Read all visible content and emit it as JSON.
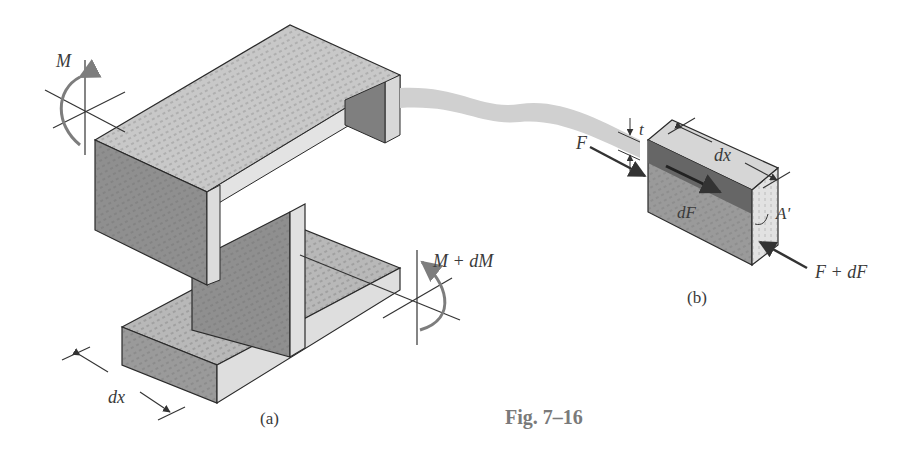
{
  "figure": {
    "caption": "Fig. 7–16",
    "part_a": {
      "label": "(a)",
      "moment_left": "M",
      "moment_right": "M + dM",
      "dimension": "dx"
    },
    "part_b": {
      "label": "(b)",
      "force_in": "F",
      "force_out": "F + dF",
      "thickness": "t",
      "dimension": "dx",
      "shear_force": "dF",
      "area": "A'"
    },
    "colors": {
      "wood_top": "#c8c8c8",
      "wood_side": "#8f8f8f",
      "wood_end": "#dcdcdc",
      "strip": "#d0d0d0",
      "outline": "#2a2a2a",
      "arrow_gray": "#7d7d7d",
      "caption": "#7a7a7a"
    }
  }
}
